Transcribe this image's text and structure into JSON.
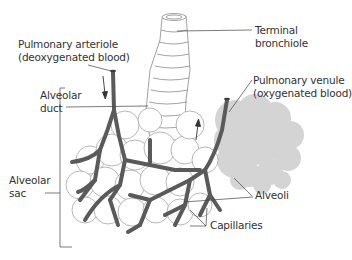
{
  "diagram": {
    "labels": {
      "pulmonary_arteriole": "Pulmonary arteriole\n(deoxygenated blood)",
      "terminal_bronchiole": "Terminal\nbronchiole",
      "alveolar_duct": "Alveolar\nduct",
      "pulmonary_venule": "Pulmonary venule\n(oxygenated blood)",
      "alveolar_sac": "Alveolar\nsac",
      "alveoli": "Alveoli",
      "capillaries": "Capillaries"
    },
    "colors": {
      "vessel": "#5a5a5a",
      "outline": "#9a9a9a",
      "alveoli_fill": "#d4d4d4",
      "leader_line": "#444444",
      "text": "#333333"
    }
  }
}
